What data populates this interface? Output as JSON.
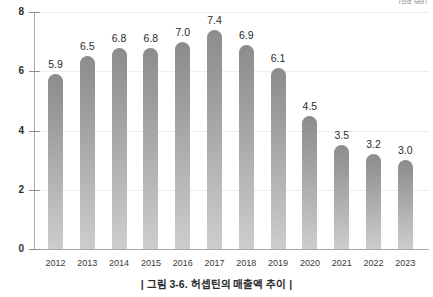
{
  "unit_label": "(십억 달러)",
  "caption": "| 그림 3-6. 허셉틴의 매출액 추이 |",
  "chart_data": {
    "type": "bar",
    "title": "",
    "subtitle": "",
    "xlabel": "",
    "ylabel": "",
    "unit": "(십억 달러)",
    "categories": [
      "2012",
      "2013",
      "2014",
      "2015",
      "2016",
      "2017",
      "2018",
      "2019",
      "2020",
      "2021",
      "2022",
      "2023"
    ],
    "values": [
      5.9,
      6.5,
      6.8,
      6.8,
      7.0,
      7.4,
      6.9,
      6.1,
      4.5,
      3.5,
      3.2,
      3.0
    ],
    "value_labels": [
      "5.9",
      "6.5",
      "6.8",
      "6.8",
      "7.0",
      "7.4",
      "6.9",
      "6.1",
      "4.5",
      "3.5",
      "3.2",
      "3.0"
    ],
    "ylim": [
      0,
      8
    ],
    "yticks": [
      0,
      2,
      4,
      6,
      8
    ],
    "ytick_labels": [
      "0",
      "2",
      "4",
      "6",
      "8"
    ],
    "grid": true,
    "grid_axis": "y",
    "legend": false,
    "bar_color_top": "#8c8c8c",
    "bar_color_bottom": "#cdcdcd",
    "axis_color": "#a8a8a8",
    "grid_color": "#ededed",
    "background": "#ffffff"
  }
}
